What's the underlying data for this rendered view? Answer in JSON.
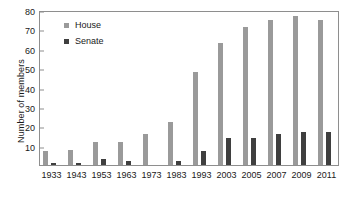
{
  "chart_data": {
    "type": "bar",
    "title": "",
    "subtitle": "",
    "xlabel": "",
    "ylabel": "Number of members",
    "ylim": [
      0,
      80
    ],
    "ytick_labels": [
      "80",
      "70",
      "60",
      "50",
      "40",
      "30",
      "20",
      "10"
    ],
    "ytick_values": [
      80,
      70,
      60,
      50,
      40,
      30,
      20,
      10
    ],
    "grid": false,
    "legend_position": "top-left",
    "categories": [
      "1933",
      "1943",
      "1953",
      "1963",
      "1973",
      "1983",
      "1993",
      "2003",
      "2005",
      "2007",
      "2009",
      "2011"
    ],
    "series": [
      {
        "name": "House",
        "color": "#9a9a9a",
        "values": [
          7,
          8,
          12,
          12,
          16,
          22,
          48,
          63,
          71,
          75,
          77,
          75
        ]
      },
      {
        "name": "Senate",
        "color": "#3f3f3f",
        "values": [
          1,
          1,
          3,
          2,
          0,
          2,
          7,
          14,
          14,
          16,
          17,
          17
        ]
      }
    ]
  },
  "legend": {
    "items": [
      {
        "label": "House",
        "color": "#9a9a9a"
      },
      {
        "label": "Senate",
        "color": "#3f3f3f"
      }
    ]
  },
  "axis": {
    "y_title": "Number of members"
  }
}
